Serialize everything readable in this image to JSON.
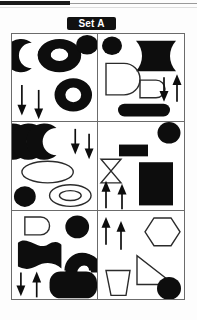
{
  "header": {
    "set_label": "Set A",
    "label_bg_color": "#111111",
    "label_text_color": "#ffffff"
  },
  "scan_artifacts": {
    "top_black_bar": "black-bar",
    "top_gray_rule": "gray-rule"
  },
  "grid": {
    "columns": 2,
    "rows": 3,
    "border_color": "#6b6b6b",
    "background_color": "#ffffff",
    "fill_color": "#0d0d0d",
    "outline_color": "#2b2b2b"
  },
  "panels": [
    {
      "id": "panel-1",
      "position": "top-left",
      "shapes": [
        {
          "name": "crescent-moon",
          "style": "filled",
          "count": 1
        },
        {
          "name": "annulus-large",
          "style": "filled",
          "count": 1
        },
        {
          "name": "circle-small",
          "style": "filled",
          "count": 1
        },
        {
          "name": "annulus-medium",
          "style": "filled",
          "count": 1
        },
        {
          "name": "arrow-down",
          "style": "filled",
          "count": 2
        }
      ],
      "arrows": {
        "up": 0,
        "down": 2
      }
    },
    {
      "id": "panel-2",
      "position": "top-right",
      "shapes": [
        {
          "name": "circle-small",
          "style": "filled",
          "count": 1
        },
        {
          "name": "curved-flag-block",
          "style": "filled",
          "count": 1
        },
        {
          "name": "d-shape-large",
          "style": "outlined",
          "count": 1
        },
        {
          "name": "d-shape-small",
          "style": "outlined",
          "count": 1
        },
        {
          "name": "stadium-bar",
          "style": "filled",
          "count": 1
        },
        {
          "name": "arrow-down",
          "style": "filled",
          "count": 1
        },
        {
          "name": "arrow-up",
          "style": "filled",
          "count": 1
        }
      ],
      "arrows": {
        "up": 1,
        "down": 1
      }
    },
    {
      "id": "panel-3",
      "position": "middle-left",
      "shapes": [
        {
          "name": "crescent-moon",
          "style": "filled",
          "count": 3
        },
        {
          "name": "ellipse-large",
          "style": "outlined",
          "count": 1
        },
        {
          "name": "circle-small",
          "style": "filled",
          "count": 1
        },
        {
          "name": "ellipse-annulus",
          "style": "outlined",
          "count": 1
        },
        {
          "name": "arrow-down",
          "style": "filled",
          "count": 2
        }
      ],
      "arrows": {
        "up": 0,
        "down": 2
      }
    },
    {
      "id": "panel-4",
      "position": "middle-right",
      "shapes": [
        {
          "name": "circle-small",
          "style": "filled",
          "count": 1
        },
        {
          "name": "rectangle-small",
          "style": "filled",
          "count": 1
        },
        {
          "name": "hourglass-bowtie",
          "style": "outlined",
          "count": 1
        },
        {
          "name": "rectangle-large",
          "style": "filled",
          "count": 1
        },
        {
          "name": "arrow-up",
          "style": "filled",
          "count": 2
        }
      ],
      "arrows": {
        "up": 2,
        "down": 0
      }
    },
    {
      "id": "panel-5",
      "position": "bottom-left",
      "shapes": [
        {
          "name": "d-shape-small",
          "style": "outlined",
          "count": 1
        },
        {
          "name": "circle-small",
          "style": "filled",
          "count": 1
        },
        {
          "name": "wave-flag",
          "style": "filled",
          "count": 1
        },
        {
          "name": "arch-half-annulus",
          "style": "filled",
          "count": 1
        },
        {
          "name": "rounded-rectangle-large",
          "style": "filled",
          "count": 1
        },
        {
          "name": "arrow-down",
          "style": "filled",
          "count": 1
        },
        {
          "name": "arrow-up",
          "style": "filled",
          "count": 1
        }
      ],
      "arrows": {
        "up": 1,
        "down": 1
      }
    },
    {
      "id": "panel-6",
      "position": "bottom-right",
      "shapes": [
        {
          "name": "arrow-up",
          "style": "filled",
          "count": 2
        },
        {
          "name": "hexagon",
          "style": "outlined",
          "count": 1
        },
        {
          "name": "right-triangle",
          "style": "outlined",
          "count": 1
        },
        {
          "name": "trapezoid",
          "style": "outlined",
          "count": 1
        },
        {
          "name": "circle-small",
          "style": "filled",
          "count": 1
        }
      ],
      "arrows": {
        "up": 2,
        "down": 0
      }
    }
  ]
}
